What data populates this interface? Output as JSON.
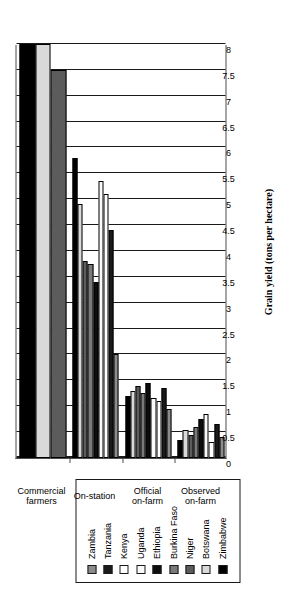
{
  "chart_data": {
    "type": "bar",
    "orientation": "horizontal",
    "title": "",
    "xlabel": "",
    "ylabel": "Grain yield (tons per hectare)",
    "ylim": [
      0,
      8
    ],
    "ytick_step": 0.5,
    "yticks": [
      "0",
      "0.5",
      "1",
      "1.5",
      "2",
      "2.5",
      "3",
      "3.5",
      "4",
      "4.5",
      "5",
      "5.5",
      "6",
      "6.5",
      "7",
      "7.5",
      "8"
    ],
    "grid": true,
    "legend_position": "top-left",
    "categories": [
      "Observed on-farm",
      "Official on-farm",
      "On-station",
      "Commercial farmers"
    ],
    "series": [
      {
        "name": "Zambia",
        "color": "#8c8c8c",
        "values": [
          0.4,
          0.95,
          2.0,
          null
        ]
      },
      {
        "name": "Tanzania",
        "color": "#1a1a1a",
        "values": [
          0.65,
          1.35,
          4.4,
          null
        ]
      },
      {
        "name": "Kenya",
        "color": "#ffffff",
        "values": [
          0.3,
          1.1,
          5.1,
          null
        ]
      },
      {
        "name": "Uganda",
        "color": "#fafafa",
        "values": [
          0.85,
          1.15,
          5.35,
          null
        ]
      },
      {
        "name": "Ethiopia",
        "color": "#0d0d0d",
        "values": [
          0.75,
          1.45,
          3.4,
          null
        ]
      },
      {
        "name": "Burkina Faso",
        "color": "#7a7a7a",
        "values": [
          0.6,
          1.25,
          3.75,
          null
        ]
      },
      {
        "name": "Niger",
        "color": "#5c5c5c",
        "values": [
          0.45,
          1.4,
          3.8,
          7.5
        ]
      },
      {
        "name": "Botswana",
        "color": "#d9d9d9",
        "values": [
          0.55,
          1.3,
          4.9,
          8.0
        ]
      },
      {
        "name": "Zimbabwe",
        "color": "#000000",
        "values": [
          0.35,
          1.2,
          5.8,
          8.0
        ]
      }
    ]
  },
  "legend": {
    "items": [
      {
        "label": "Zambia",
        "color": "#8c8c8c"
      },
      {
        "label": "Tanzania",
        "color": "#1a1a1a"
      },
      {
        "label": "Kenya",
        "color": "#ffffff"
      },
      {
        "label": "Uganda",
        "color": "#fafafa"
      },
      {
        "label": "Ethiopia",
        "color": "#0d0d0d"
      },
      {
        "label": "Burkina Faso",
        "color": "#7a7a7a"
      },
      {
        "label": "Niger",
        "color": "#5c5c5c"
      },
      {
        "label": "Botswana",
        "color": "#d9d9d9"
      },
      {
        "label": "Zimbabwe",
        "color": "#000000"
      }
    ]
  },
  "axis": {
    "value_axis_title": "Grain yield (tons per hectare)"
  },
  "categories_display": [
    {
      "lines": [
        "Observed",
        "on-farm"
      ]
    },
    {
      "lines": [
        "Official",
        "on-farm"
      ]
    },
    {
      "lines": [
        "On-station"
      ]
    },
    {
      "lines": [
        "Commercial",
        "farmers"
      ]
    }
  ]
}
